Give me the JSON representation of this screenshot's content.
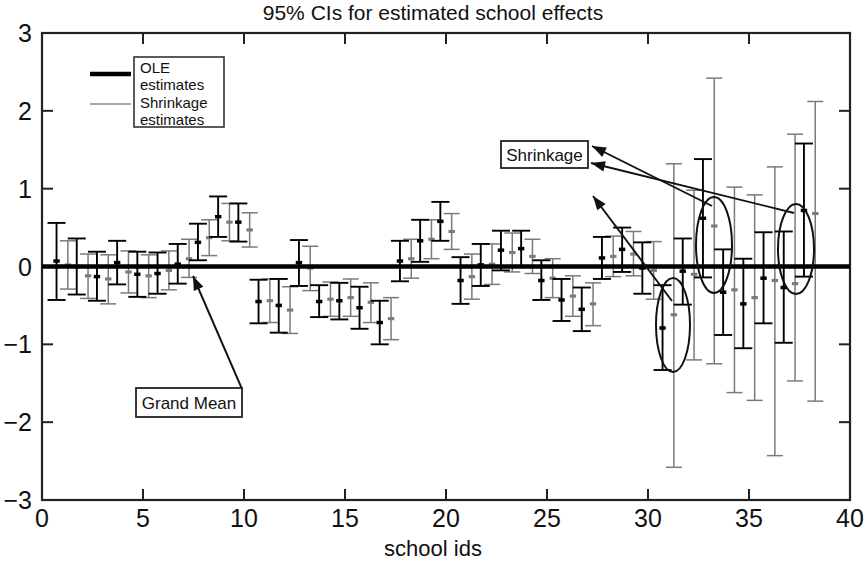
{
  "chart_data": {
    "type": "scatter",
    "title": "95% CIs for estimated school effects",
    "xlabel": "school ids",
    "ylabel": "",
    "xlim": [
      0,
      40
    ],
    "ylim": [
      -3,
      3
    ],
    "xticks": [
      0,
      5,
      10,
      15,
      20,
      25,
      30,
      35,
      40
    ],
    "xtick_labels": [
      "0",
      "5",
      "10",
      "15",
      "20",
      "25",
      "30",
      "35",
      "40"
    ],
    "yticks": [
      -3,
      -2,
      -1,
      0,
      1,
      2,
      3
    ],
    "ytick_labels": [
      "-3",
      "-2",
      "-1",
      "0",
      "1",
      "2",
      "3"
    ],
    "grid": false,
    "legend_position": "upper-left",
    "legend": [
      {
        "label": "OLE estimates",
        "style": "thick-line",
        "color": "#000000"
      },
      {
        "label": "Shrinkage estimates",
        "style": "thin-line",
        "color": "#808080"
      }
    ],
    "grand_mean_line": {
      "y": 0.0,
      "color": "#000000",
      "label": "Grand Mean"
    },
    "series": [
      {
        "name": "OLE estimates",
        "color": "#000000",
        "points": [
          {
            "school": 1,
            "x": 0.72,
            "est": 0.07,
            "lo": -0.43,
            "hi": 0.56
          },
          {
            "school": 2,
            "x": 1.72,
            "est": 0.0,
            "lo": -0.36,
            "hi": 0.36
          },
          {
            "school": 3,
            "x": 2.72,
            "est": -0.13,
            "lo": -0.44,
            "hi": 0.19
          },
          {
            "school": 4,
            "x": 3.72,
            "est": 0.05,
            "lo": -0.23,
            "hi": 0.33
          },
          {
            "school": 5,
            "x": 4.72,
            "est": -0.1,
            "lo": -0.39,
            "hi": 0.19
          },
          {
            "school": 6,
            "x": 5.72,
            "est": -0.09,
            "lo": -0.35,
            "hi": 0.18
          },
          {
            "school": 7,
            "x": 6.72,
            "est": 0.03,
            "lo": -0.22,
            "hi": 0.29
          },
          {
            "school": 8,
            "x": 7.72,
            "est": 0.31,
            "lo": 0.08,
            "hi": 0.55
          },
          {
            "school": 9,
            "x": 8.72,
            "est": 0.64,
            "lo": 0.38,
            "hi": 0.9
          },
          {
            "school": 10,
            "x": 9.72,
            "est": 0.57,
            "lo": 0.32,
            "hi": 0.81
          },
          {
            "school": 11,
            "x": 10.72,
            "est": -0.45,
            "lo": -0.73,
            "hi": -0.17
          },
          {
            "school": 12,
            "x": 11.72,
            "est": -0.5,
            "lo": -0.85,
            "hi": -0.16
          },
          {
            "school": 13,
            "x": 12.72,
            "est": 0.05,
            "lo": -0.25,
            "hi": 0.34
          },
          {
            "school": 14,
            "x": 13.72,
            "est": -0.45,
            "lo": -0.65,
            "hi": -0.24
          },
          {
            "school": 15,
            "x": 14.72,
            "est": -0.44,
            "lo": -0.68,
            "hi": -0.21
          },
          {
            "school": 16,
            "x": 15.72,
            "est": -0.53,
            "lo": -0.8,
            "hi": -0.26
          },
          {
            "school": 17,
            "x": 16.72,
            "est": -0.72,
            "lo": -1.0,
            "hi": -0.44
          },
          {
            "school": 18,
            "x": 17.72,
            "est": 0.07,
            "lo": -0.19,
            "hi": 0.33
          },
          {
            "school": 19,
            "x": 18.72,
            "est": 0.33,
            "lo": 0.06,
            "hi": 0.6
          },
          {
            "school": 20,
            "x": 19.72,
            "est": 0.58,
            "lo": 0.33,
            "hi": 0.83
          },
          {
            "school": 21,
            "x": 20.72,
            "est": -0.18,
            "lo": -0.48,
            "hi": 0.12
          },
          {
            "school": 22,
            "x": 21.72,
            "est": 0.02,
            "lo": -0.25,
            "hi": 0.29
          },
          {
            "school": 23,
            "x": 22.72,
            "est": 0.21,
            "lo": -0.05,
            "hi": 0.46
          },
          {
            "school": 24,
            "x": 23.72,
            "est": 0.23,
            "lo": 0.0,
            "hi": 0.46
          },
          {
            "school": 25,
            "x": 24.72,
            "est": -0.18,
            "lo": -0.43,
            "hi": 0.08
          },
          {
            "school": 26,
            "x": 25.72,
            "est": -0.43,
            "lo": -0.7,
            "hi": -0.16
          },
          {
            "school": 27,
            "x": 26.72,
            "est": -0.55,
            "lo": -0.83,
            "hi": -0.27
          },
          {
            "school": 28,
            "x": 27.72,
            "est": 0.11,
            "lo": -0.16,
            "hi": 0.38
          },
          {
            "school": 29,
            "x": 28.72,
            "est": 0.22,
            "lo": -0.07,
            "hi": 0.5
          },
          {
            "school": 30,
            "x": 29.72,
            "est": -0.02,
            "lo": -0.35,
            "hi": 0.31
          },
          {
            "school": 31,
            "x": 30.72,
            "est": -0.79,
            "lo": -1.33,
            "hi": -0.24
          },
          {
            "school": 32,
            "x": 31.72,
            "est": -0.06,
            "lo": -0.49,
            "hi": 0.36
          },
          {
            "school": 33,
            "x": 32.72,
            "est": 0.62,
            "lo": -0.14,
            "hi": 1.38
          },
          {
            "school": 34,
            "x": 33.72,
            "est": -0.33,
            "lo": -0.88,
            "hi": 0.22
          },
          {
            "school": 35,
            "x": 34.72,
            "est": -0.48,
            "lo": -1.05,
            "hi": 0.1
          },
          {
            "school": 36,
            "x": 35.72,
            "est": -0.15,
            "lo": -0.73,
            "hi": 0.44
          },
          {
            "school": 37,
            "x": 36.72,
            "est": -0.27,
            "lo": -0.98,
            "hi": 0.45
          },
          {
            "school": 38,
            "x": 37.72,
            "est": 0.72,
            "lo": -0.13,
            "hi": 1.58
          }
        ]
      },
      {
        "name": "Shrinkage estimates",
        "color": "#7a7a7a",
        "points": [
          {
            "school": 1,
            "x": 1.28,
            "est": 0.02,
            "lo": -0.29,
            "hi": 0.33
          },
          {
            "school": 2,
            "x": 2.28,
            "est": -0.12,
            "lo": -0.41,
            "hi": 0.16
          },
          {
            "school": 3,
            "x": 3.28,
            "est": -0.16,
            "lo": -0.48,
            "hi": 0.15
          },
          {
            "school": 4,
            "x": 4.28,
            "est": -0.07,
            "lo": -0.34,
            "hi": 0.2
          },
          {
            "school": 5,
            "x": 5.28,
            "est": -0.12,
            "lo": -0.4,
            "hi": 0.15
          },
          {
            "school": 6,
            "x": 6.28,
            "est": -0.05,
            "lo": -0.3,
            "hi": 0.2
          },
          {
            "school": 7,
            "x": 7.28,
            "est": 0.1,
            "lo": -0.14,
            "hi": 0.35
          },
          {
            "school": 8,
            "x": 8.28,
            "est": 0.37,
            "lo": 0.14,
            "hi": 0.6
          },
          {
            "school": 9,
            "x": 9.28,
            "est": 0.57,
            "lo": 0.33,
            "hi": 0.81
          },
          {
            "school": 10,
            "x": 10.28,
            "est": 0.47,
            "lo": 0.25,
            "hi": 0.69
          },
          {
            "school": 11,
            "x": 11.28,
            "est": -0.44,
            "lo": -0.72,
            "hi": -0.16
          },
          {
            "school": 12,
            "x": 12.28,
            "est": -0.56,
            "lo": -0.86,
            "hi": -0.26
          },
          {
            "school": 13,
            "x": 13.28,
            "est": -0.02,
            "lo": -0.31,
            "hi": 0.26
          },
          {
            "school": 14,
            "x": 14.28,
            "est": -0.42,
            "lo": -0.64,
            "hi": -0.2
          },
          {
            "school": 15,
            "x": 15.28,
            "est": -0.4,
            "lo": -0.64,
            "hi": -0.16
          },
          {
            "school": 16,
            "x": 16.28,
            "est": -0.46,
            "lo": -0.72,
            "hi": -0.21
          },
          {
            "school": 17,
            "x": 17.28,
            "est": -0.67,
            "lo": -0.94,
            "hi": -0.4
          },
          {
            "school": 18,
            "x": 18.28,
            "est": 0.1,
            "lo": -0.15,
            "hi": 0.35
          },
          {
            "school": 19,
            "x": 19.28,
            "est": 0.35,
            "lo": 0.1,
            "hi": 0.6
          },
          {
            "school": 20,
            "x": 20.28,
            "est": 0.45,
            "lo": 0.22,
            "hi": 0.68
          },
          {
            "school": 21,
            "x": 21.28,
            "est": -0.13,
            "lo": -0.42,
            "hi": 0.16
          },
          {
            "school": 22,
            "x": 22.28,
            "est": 0.03,
            "lo": -0.23,
            "hi": 0.29
          },
          {
            "school": 23,
            "x": 23.28,
            "est": 0.18,
            "lo": -0.07,
            "hi": 0.43
          },
          {
            "school": 24,
            "x": 24.28,
            "est": 0.13,
            "lo": -0.09,
            "hi": 0.35
          },
          {
            "school": 25,
            "x": 25.28,
            "est": -0.15,
            "lo": -0.4,
            "hi": 0.1
          },
          {
            "school": 26,
            "x": 26.28,
            "est": -0.38,
            "lo": -0.64,
            "hi": -0.12
          },
          {
            "school": 27,
            "x": 27.28,
            "est": -0.48,
            "lo": -0.76,
            "hi": -0.21
          },
          {
            "school": 28,
            "x": 28.28,
            "est": 0.13,
            "lo": -0.13,
            "hi": 0.39
          },
          {
            "school": 29,
            "x": 29.28,
            "est": 0.16,
            "lo": -0.12,
            "hi": 0.45
          },
          {
            "school": 30,
            "x": 30.28,
            "est": -0.05,
            "lo": -0.42,
            "hi": 0.32
          },
          {
            "school": 31,
            "x": 31.28,
            "est": -0.62,
            "lo": -2.58,
            "hi": 1.32
          },
          {
            "school": 32,
            "x": 32.28,
            "est": -0.1,
            "lo": -1.2,
            "hi": 0.98
          },
          {
            "school": 33,
            "x": 33.28,
            "est": 0.52,
            "lo": -1.25,
            "hi": 2.42
          },
          {
            "school": 34,
            "x": 34.28,
            "est": -0.3,
            "lo": -1.62,
            "hi": 1.02
          },
          {
            "school": 35,
            "x": 35.28,
            "est": -0.4,
            "lo": -1.72,
            "hi": 0.92
          },
          {
            "school": 36,
            "x": 36.28,
            "est": -0.18,
            "lo": -2.43,
            "hi": 1.28
          },
          {
            "school": 37,
            "x": 37.28,
            "est": -0.22,
            "lo": -1.47,
            "hi": 1.7
          },
          {
            "school": 38,
            "x": 38.28,
            "est": 0.68,
            "lo": -1.73,
            "hi": 2.12
          }
        ]
      }
    ],
    "annotations": [
      {
        "text": "Grand Mean",
        "box_x": 136,
        "box_y": 388,
        "box_w": 106,
        "box_h": 29,
        "arrow_from_x": 242,
        "arrow_from_y": 389,
        "arrow_to_x": 193,
        "arrow_to_y": 276
      },
      {
        "text": "Shrinkage",
        "box_x": 501,
        "box_y": 141,
        "box_w": 87,
        "box_h": 27,
        "arrows": [
          {
            "from_x": 591,
            "from_y": 163,
            "to_x": 794,
            "to_y": 213
          },
          {
            "from_x": 592,
            "from_y": 146,
            "to_x": 712,
            "to_y": 206
          },
          {
            "from_x": 593,
            "from_y": 196,
            "to_x": 672,
            "to_y": 301
          }
        ]
      }
    ],
    "highlight_ellipses": [
      {
        "cx": 673,
        "cy": 325,
        "rx": 17,
        "ry": 47,
        "label": "shrinkage-highlight-31"
      },
      {
        "cx": 714,
        "cy": 245,
        "rx": 18,
        "ry": 48,
        "label": "shrinkage-highlight-33"
      },
      {
        "cx": 796,
        "cy": 249,
        "rx": 18,
        "ry": 45,
        "label": "shrinkage-highlight-38"
      }
    ]
  },
  "legend": {
    "ole_label_line1": "OLE",
    "ole_label_line2": "estimates",
    "shrinkage_label_line1": "Shrinkage",
    "shrinkage_label_line2": "estimates"
  },
  "annotations": {
    "grand_mean": "Grand Mean",
    "shrinkage": "Shrinkage"
  }
}
